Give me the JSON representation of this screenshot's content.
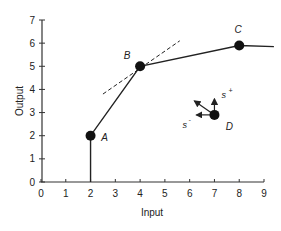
{
  "chart_data": {
    "type": "line",
    "title": "",
    "xlabel": "Input",
    "ylabel": "Output",
    "xlim": [
      0,
      9
    ],
    "ylim": [
      0,
      7
    ],
    "x_ticks": [
      "0",
      "1",
      "2",
      "3",
      "4",
      "5",
      "6",
      "7",
      "8",
      "9"
    ],
    "y_ticks": [
      "0",
      "1",
      "2",
      "3",
      "4",
      "5",
      "6",
      "7"
    ],
    "grid": false,
    "series": [
      {
        "name": "frontier",
        "x": [
          2,
          2,
          4,
          8,
          9.4
        ],
        "y": [
          0,
          2,
          5,
          5.9,
          5.85
        ]
      }
    ],
    "tangent_line": {
      "style": "dashed",
      "through": "B",
      "x": [
        2.5,
        5.6
      ],
      "y": [
        3.8,
        6.1
      ]
    },
    "points": [
      {
        "label": "A",
        "x": 2,
        "y": 2
      },
      {
        "label": "B",
        "x": 4,
        "y": 5
      },
      {
        "label": "C",
        "x": 8,
        "y": 5.9
      },
      {
        "label": "D",
        "x": 7,
        "y": 2.9
      }
    ],
    "annotations": [
      {
        "text": "s+",
        "near": "D",
        "direction": "up"
      },
      {
        "text": "s-",
        "near": "D",
        "direction": "left"
      }
    ]
  }
}
